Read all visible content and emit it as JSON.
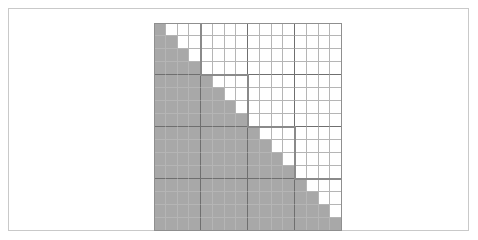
{
  "figure": {
    "kind": "matrix-sparsity-grid"
  },
  "chart_data": {
    "type": "heatmap",
    "title": "",
    "subtitle": "",
    "xlabel": "",
    "ylabel": "",
    "rows": 16,
    "columns": 16,
    "row_labels": [
      "1",
      "2",
      "3",
      "4",
      "5",
      "6",
      "7",
      "8",
      "9",
      "10",
      "11",
      "12",
      "13",
      "14",
      "15",
      "16"
    ],
    "column_labels": [
      "1",
      "2",
      "3",
      "4",
      "5",
      "6",
      "7",
      "8",
      "9",
      "10",
      "11",
      "12",
      "13",
      "14",
      "15",
      "16"
    ],
    "legend": [],
    "grid": true,
    "block_size": 4,
    "blocks_per_side": 4,
    "fill_rule": "lower-triangular-inclusive",
    "filled_cell_count": 136,
    "empty_cell_count": 120,
    "values": [
      [
        1,
        0,
        0,
        0,
        0,
        0,
        0,
        0,
        0,
        0,
        0,
        0,
        0,
        0,
        0,
        0
      ],
      [
        1,
        1,
        0,
        0,
        0,
        0,
        0,
        0,
        0,
        0,
        0,
        0,
        0,
        0,
        0,
        0
      ],
      [
        1,
        1,
        1,
        0,
        0,
        0,
        0,
        0,
        0,
        0,
        0,
        0,
        0,
        0,
        0,
        0
      ],
      [
        1,
        1,
        1,
        1,
        0,
        0,
        0,
        0,
        0,
        0,
        0,
        0,
        0,
        0,
        0,
        0
      ],
      [
        1,
        1,
        1,
        1,
        1,
        0,
        0,
        0,
        0,
        0,
        0,
        0,
        0,
        0,
        0,
        0
      ],
      [
        1,
        1,
        1,
        1,
        1,
        1,
        0,
        0,
        0,
        0,
        0,
        0,
        0,
        0,
        0,
        0
      ],
      [
        1,
        1,
        1,
        1,
        1,
        1,
        1,
        0,
        0,
        0,
        0,
        0,
        0,
        0,
        0,
        0
      ],
      [
        1,
        1,
        1,
        1,
        1,
        1,
        1,
        1,
        0,
        0,
        0,
        0,
        0,
        0,
        0,
        0
      ],
      [
        1,
        1,
        1,
        1,
        1,
        1,
        1,
        1,
        1,
        0,
        0,
        0,
        0,
        0,
        0,
        0
      ],
      [
        1,
        1,
        1,
        1,
        1,
        1,
        1,
        1,
        1,
        1,
        0,
        0,
        0,
        0,
        0,
        0
      ],
      [
        1,
        1,
        1,
        1,
        1,
        1,
        1,
        1,
        1,
        1,
        1,
        0,
        0,
        0,
        0,
        0
      ],
      [
        1,
        1,
        1,
        1,
        1,
        1,
        1,
        1,
        1,
        1,
        1,
        1,
        0,
        0,
        0,
        0
      ],
      [
        1,
        1,
        1,
        1,
        1,
        1,
        1,
        1,
        1,
        1,
        1,
        1,
        1,
        0,
        0,
        0
      ],
      [
        1,
        1,
        1,
        1,
        1,
        1,
        1,
        1,
        1,
        1,
        1,
        1,
        1,
        1,
        0,
        0
      ],
      [
        1,
        1,
        1,
        1,
        1,
        1,
        1,
        1,
        1,
        1,
        1,
        1,
        1,
        1,
        1,
        0
      ],
      [
        1,
        1,
        1,
        1,
        1,
        1,
        1,
        1,
        1,
        1,
        1,
        1,
        1,
        1,
        1,
        1
      ]
    ],
    "colors": {
      "filled": "#a8a8a8",
      "empty": "#ffffff",
      "gridline": "#b5b5b5",
      "block_separator": "#6f6f6f",
      "outline": "#8a8a8a",
      "page_frame": "#c9c9c9"
    }
  }
}
